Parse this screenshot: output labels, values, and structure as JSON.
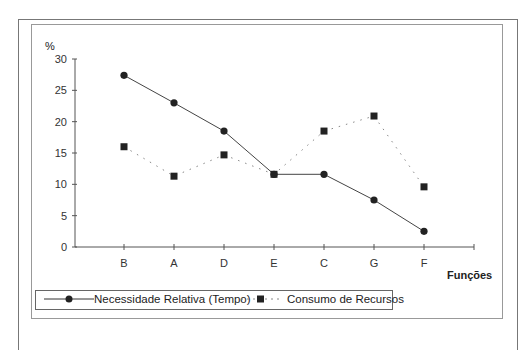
{
  "chart_data": {
    "type": "line",
    "title": "",
    "xlabel": "Funções",
    "ylabel": "%",
    "categories": [
      "B",
      "A",
      "D",
      "E",
      "C",
      "G",
      "F"
    ],
    "ylim": [
      0,
      30
    ],
    "yticks": [
      0,
      5,
      10,
      15,
      20,
      25,
      30
    ],
    "grid": false,
    "legend_position": "bottom",
    "series": [
      {
        "name": "Necessidade Relativa (Tempo)",
        "marker": "circle",
        "line": "solid",
        "values": [
          27.4,
          23.0,
          18.5,
          11.6,
          11.6,
          7.5,
          2.5
        ]
      },
      {
        "name": "Consumo de Recursos",
        "marker": "square",
        "line": "dotted",
        "values": [
          16.0,
          11.3,
          14.7,
          11.6,
          18.5,
          20.9,
          9.6
        ]
      }
    ]
  },
  "axis": {
    "x_title": "Funções",
    "y_title": "%"
  },
  "legend": {
    "series1": "Necessidade Relativa (Tempo)",
    "series2": "Consumo de Recursos"
  },
  "colors": {
    "line": "#333333",
    "dotted": "#888888",
    "marker": "#222222"
  }
}
